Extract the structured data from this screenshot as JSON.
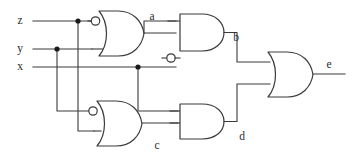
{
  "diagram": {
    "stroke_color": "#3a3a3a",
    "background_color": "#ffffff",
    "label_color": "#2b2b2b",
    "inputs": [
      {
        "id": "z",
        "label": "z",
        "x": 20,
        "y": 21
      },
      {
        "id": "y",
        "label": "y",
        "x": 20,
        "y": 49
      },
      {
        "id": "x",
        "label": "x",
        "x": 20,
        "y": 67
      }
    ],
    "signals": [
      {
        "id": "a",
        "label": "a",
        "x": 152,
        "y": 21
      },
      {
        "id": "b",
        "label": "b",
        "x": 236,
        "y": 40
      },
      {
        "id": "c",
        "label": "c",
        "x": 157,
        "y": 147
      },
      {
        "id": "d",
        "label": "d",
        "x": 242,
        "y": 139
      },
      {
        "id": "e",
        "label": "e",
        "x": 329,
        "y": 66
      }
    ],
    "gates": [
      {
        "id": "gate-a",
        "type": "or",
        "label": "a",
        "inverted_inputs": [
          "top"
        ],
        "inverted_output": false,
        "x": 95,
        "y": 11,
        "width": 45,
        "height": 45
      },
      {
        "id": "gate-b",
        "type": "and",
        "label": "b",
        "inverted_inputs": [
          "bottom"
        ],
        "inverted_output": false,
        "x": 176,
        "y": 21,
        "width": 45,
        "height": 45
      },
      {
        "id": "gate-c",
        "type": "or",
        "label": "c",
        "inverted_inputs": [
          "top"
        ],
        "inverted_output": false,
        "x": 92,
        "y": 100,
        "width": 45,
        "height": 45
      },
      {
        "id": "gate-d",
        "type": "and",
        "label": "d",
        "inverted_inputs": [],
        "inverted_output": false,
        "x": 176,
        "y": 100,
        "width": 45,
        "height": 45
      },
      {
        "id": "gate-e",
        "type": "or",
        "label": "e",
        "inverted_inputs": [],
        "inverted_output": false,
        "x": 268,
        "y": 50,
        "width": 45,
        "height": 45
      }
    ],
    "junctions": [
      {
        "id": "junction-z",
        "on": "z",
        "x": 78,
        "y": 21
      },
      {
        "id": "junction-y",
        "on": "y",
        "x": 57,
        "y": 49
      },
      {
        "id": "junction-x",
        "on": "x",
        "x": 138,
        "y": 67
      }
    ],
    "wire_paths": {
      "z_input": "M 33 21 L 95 21",
      "y_input": "M 33 49 L 95 49",
      "x_input": "M 33 67 L 176 67",
      "z_branch_down": "M 78 21 L 78 131 L 92 131",
      "y_branch_down": "M 57 49 L 57 110 L 92 110",
      "x_branch_down": "M 138 67 L 138 110 L 176 110",
      "a_to_b": "M 140 21 L 176 32",
      "a_out": "M 140 21 L 176 21",
      "b_to_e": "M 221 43 L 237 43 L 237 62 L 268 62",
      "c_to_d": "M 137 122 L 176 122",
      "d_to_e": "M 221 122 L 237 122 L 237 84 L 268 84",
      "e_out": "M 313 73 L 345 73"
    }
  }
}
